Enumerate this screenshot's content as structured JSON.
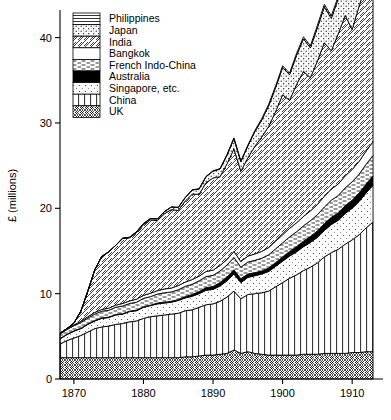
{
  "chart_data": {
    "type": "area",
    "title": "",
    "subtitle": "",
    "xlabel": "",
    "ylabel": "£ (millions)",
    "xlim": [
      1868,
      1914
    ],
    "ylim": [
      0,
      43
    ],
    "grid": false,
    "legend_position": "top-left inside",
    "stacked": true,
    "stack_order_bottom_to_top": [
      "UK",
      "China",
      "Singapore, etc.",
      "Australia",
      "French Indo-China",
      "Bangkok",
      "India",
      "Japan",
      "Philippines"
    ],
    "x_ticks": [
      1870,
      1880,
      1890,
      1900,
      1910
    ],
    "y_ticks": [
      0,
      10,
      20,
      30,
      40
    ],
    "x": [
      1868,
      1869,
      1870,
      1871,
      1872,
      1873,
      1874,
      1875,
      1876,
      1877,
      1878,
      1879,
      1880,
      1881,
      1882,
      1883,
      1884,
      1885,
      1886,
      1887,
      1888,
      1889,
      1890,
      1891,
      1892,
      1893,
      1894,
      1895,
      1896,
      1897,
      1898,
      1899,
      1900,
      1901,
      1902,
      1903,
      1904,
      1905,
      1906,
      1907,
      1908,
      1909,
      1910,
      1911,
      1912,
      1913
    ],
    "series": [
      {
        "name": "UK",
        "pattern": "crosshatch-diamond",
        "values": [
          2.5,
          2.5,
          2.5,
          2.5,
          2.5,
          2.5,
          2.5,
          2.5,
          2.5,
          2.5,
          2.5,
          2.5,
          2.5,
          2.5,
          2.5,
          2.5,
          2.5,
          2.5,
          2.6,
          2.6,
          2.7,
          2.8,
          2.8,
          2.9,
          3.0,
          3.4,
          3.0,
          3.2,
          3.0,
          2.9,
          2.8,
          2.8,
          2.8,
          2.8,
          2.8,
          2.9,
          2.9,
          2.9,
          3.0,
          3.0,
          3.0,
          3.0,
          3.1,
          3.1,
          3.2,
          3.2
        ]
      },
      {
        "name": "China",
        "pattern": "vertical-lines",
        "values": [
          1.6,
          2.0,
          2.3,
          2.6,
          3.0,
          3.4,
          3.6,
          3.7,
          3.9,
          4.0,
          4.2,
          4.3,
          4.6,
          4.8,
          4.9,
          5.0,
          5.1,
          5.2,
          5.4,
          5.5,
          5.7,
          5.9,
          6.0,
          6.2,
          6.6,
          6.9,
          6.4,
          6.7,
          7.0,
          7.2,
          7.5,
          8.0,
          8.5,
          9.0,
          9.4,
          9.8,
          10.2,
          10.7,
          11.3,
          11.8,
          12.2,
          12.8,
          13.2,
          13.8,
          14.5,
          15.2
        ]
      },
      {
        "name": "Singapore, etc.",
        "pattern": "light-stipple",
        "values": [
          0.6,
          0.7,
          0.8,
          0.8,
          0.9,
          0.9,
          1.0,
          1.0,
          1.1,
          1.1,
          1.2,
          1.2,
          1.3,
          1.3,
          1.4,
          1.4,
          1.4,
          1.5,
          1.5,
          1.6,
          1.6,
          1.7,
          1.7,
          1.8,
          1.9,
          2.0,
          1.9,
          2.0,
          2.1,
          2.2,
          2.3,
          2.4,
          2.5,
          2.6,
          2.7,
          2.8,
          2.9,
          3.0,
          3.1,
          3.3,
          3.4,
          3.6,
          3.7,
          3.9,
          4.1,
          4.3
        ]
      },
      {
        "name": "Australia",
        "pattern": "solid-black",
        "values": [
          0.05,
          0.05,
          0.05,
          0.05,
          0.05,
          0.05,
          0.05,
          0.05,
          0.05,
          0.05,
          0.05,
          0.05,
          0.05,
          0.05,
          0.1,
          0.1,
          0.1,
          0.1,
          0.15,
          0.2,
          0.25,
          0.3,
          0.35,
          0.4,
          0.45,
          0.5,
          0.45,
          0.4,
          0.35,
          0.35,
          0.4,
          0.45,
          0.5,
          0.55,
          0.6,
          0.65,
          0.7,
          0.75,
          0.8,
          0.85,
          0.85,
          0.9,
          0.95,
          1.0,
          1.05,
          1.1
        ]
      },
      {
        "name": "French Indo-China",
        "pattern": "dashed-horizontal",
        "values": [
          0.5,
          0.55,
          0.6,
          0.65,
          0.7,
          0.75,
          0.8,
          0.8,
          0.85,
          0.9,
          0.9,
          0.95,
          1.0,
          1.0,
          1.05,
          1.1,
          1.1,
          1.15,
          1.2,
          1.2,
          1.25,
          1.3,
          1.3,
          1.35,
          1.4,
          1.45,
          1.35,
          1.4,
          1.45,
          1.5,
          1.55,
          1.6,
          1.65,
          1.7,
          1.75,
          1.8,
          1.85,
          1.9,
          1.95,
          2.0,
          2.05,
          2.1,
          2.15,
          2.2,
          2.3,
          2.4
        ]
      },
      {
        "name": "Bangkok",
        "pattern": "blank-white",
        "values": [
          0.1,
          0.1,
          0.1,
          0.15,
          0.15,
          0.2,
          0.2,
          0.25,
          0.25,
          0.3,
          0.3,
          0.35,
          0.35,
          0.4,
          0.4,
          0.45,
          0.45,
          0.5,
          0.5,
          0.55,
          0.55,
          0.6,
          0.6,
          0.65,
          0.65,
          0.7,
          0.65,
          0.7,
          0.75,
          0.8,
          0.85,
          0.9,
          0.95,
          1.0,
          1.05,
          1.1,
          1.15,
          1.2,
          1.25,
          1.3,
          1.35,
          1.4,
          1.45,
          1.5,
          1.55,
          1.6
        ]
      },
      {
        "name": "India",
        "pattern": "diagonal-hatch",
        "values": [
          0.0,
          0.0,
          0.2,
          1.2,
          3.0,
          5.0,
          6.2,
          6.6,
          7.0,
          7.6,
          7.4,
          7.8,
          8.3,
          8.6,
          8.2,
          8.8,
          9.2,
          8.8,
          9.5,
          10.0,
          9.6,
          10.4,
          10.8,
          10.4,
          11.2,
          12.0,
          10.6,
          11.5,
          12.6,
          13.4,
          14.2,
          15.2,
          16.4,
          15.0,
          16.2,
          17.0,
          15.6,
          16.8,
          18.0,
          16.2,
          17.6,
          18.8,
          16.4,
          18.2,
          19.6,
          17.0
        ]
      },
      {
        "name": "Japan",
        "pattern": "stipple-dots",
        "values": [
          0.0,
          0.0,
          0.0,
          0.0,
          0.0,
          0.0,
          0.0,
          0.0,
          0.0,
          0.05,
          0.05,
          0.1,
          0.1,
          0.15,
          0.2,
          0.25,
          0.3,
          0.35,
          0.4,
          0.5,
          0.6,
          0.7,
          0.8,
          0.9,
          1.0,
          1.2,
          1.1,
          1.4,
          1.7,
          2.0,
          2.4,
          2.8,
          3.2,
          3.0,
          3.4,
          3.8,
          3.5,
          3.9,
          4.2,
          3.8,
          4.1,
          4.4,
          4.0,
          4.3,
          4.6,
          4.2
        ]
      },
      {
        "name": "Philippines",
        "pattern": "horizontal-lines",
        "values": [
          0.0,
          0.0,
          0.0,
          0.0,
          0.0,
          0.0,
          0.0,
          0.0,
          0.0,
          0.0,
          0.0,
          0.0,
          0.0,
          0.0,
          0.0,
          0.0,
          0.0,
          0.0,
          0.0,
          0.0,
          0.05,
          0.05,
          0.05,
          0.05,
          0.1,
          0.1,
          0.1,
          0.1,
          0.15,
          0.15,
          0.2,
          0.2,
          0.2,
          0.2,
          0.25,
          0.25,
          0.25,
          0.3,
          0.3,
          0.3,
          0.3,
          0.35,
          0.35,
          0.35,
          0.4,
          0.4
        ]
      }
    ]
  },
  "legend": {
    "items": [
      {
        "label": "Philippines",
        "pattern": "horizontal-lines"
      },
      {
        "label": "Japan",
        "pattern": "stipple-dots"
      },
      {
        "label": "India",
        "pattern": "diagonal-hatch"
      },
      {
        "label": "Bangkok",
        "pattern": "blank-white"
      },
      {
        "label": "French Indo-China",
        "pattern": "dashed-horizontal"
      },
      {
        "label": "Australia",
        "pattern": "solid-black"
      },
      {
        "label": "Singapore, etc.",
        "pattern": "light-stipple"
      },
      {
        "label": "China",
        "pattern": "vertical-lines"
      },
      {
        "label": "UK",
        "pattern": "crosshatch-diamond"
      }
    ]
  },
  "axes": {
    "y_title": "£ (millions)",
    "y_tick_labels": [
      "0",
      "10",
      "20",
      "30",
      "40"
    ],
    "x_tick_labels": [
      "1870",
      "1880",
      "1890",
      "1900",
      "1910"
    ]
  },
  "colors": {
    "ink": "#000000",
    "paper": "#ffffff"
  }
}
